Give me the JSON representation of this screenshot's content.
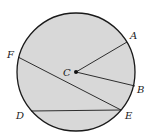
{
  "diagram": {
    "type": "circle-geometry",
    "colors": {
      "fill": "#d8d8d8",
      "stroke": "#1a1a1a",
      "background": "#ffffff"
    },
    "circle": {
      "cx": 76,
      "cy": 72,
      "r": 59
    },
    "center": {
      "label": "C",
      "x": 76,
      "y": 72
    },
    "points": [
      {
        "id": "A",
        "label": "A",
        "x": 127,
        "y": 42,
        "lx": 131,
        "ly": 40
      },
      {
        "id": "B",
        "label": "B",
        "x": 135,
        "y": 86,
        "lx": 138,
        "ly": 93
      },
      {
        "id": "D",
        "label": "D",
        "x": 31,
        "y": 111,
        "lx": 16,
        "ly": 119
      },
      {
        "id": "E",
        "label": "E",
        "x": 121,
        "y": 110,
        "lx": 125,
        "ly": 119
      },
      {
        "id": "F",
        "label": "F",
        "x": 18,
        "y": 57,
        "lx": 7,
        "ly": 57
      }
    ],
    "segments": [
      {
        "from": "C",
        "to": "A",
        "kind": "radius"
      },
      {
        "from": "C",
        "to": "B",
        "kind": "radius"
      },
      {
        "from": "F",
        "to": "E",
        "kind": "chord"
      },
      {
        "from": "D",
        "to": "E",
        "kind": "chord"
      }
    ],
    "labels": {
      "A": "A",
      "B": "B",
      "C": "C",
      "D": "D",
      "E": "E",
      "F": "F"
    }
  }
}
